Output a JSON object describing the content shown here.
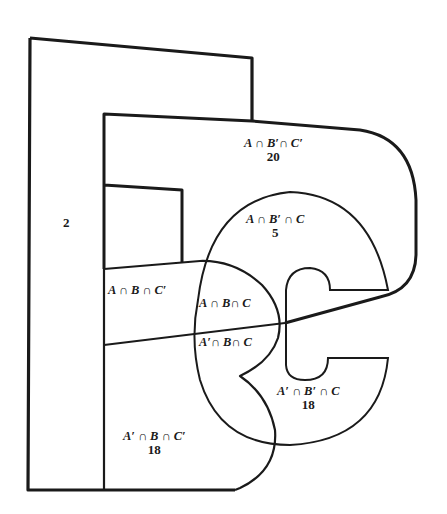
{
  "diagram": {
    "type": "venn-three-set-stylized",
    "colors": {
      "stroke": "#1a1a1a",
      "background": "#ffffff"
    },
    "regions": [
      {
        "id": "outside",
        "label": "",
        "count": "2"
      },
      {
        "id": "a-notb-notc",
        "label": "A ∩ B′∩ C′",
        "count": "20"
      },
      {
        "id": "a-notb-c",
        "label": "A ∩ B′ ∩ C",
        "count": "5"
      },
      {
        "id": "a-b-notc",
        "label": "A ∩ B ∩ C′",
        "count": ""
      },
      {
        "id": "a-b-c",
        "label": "A ∩ B∩ C",
        "count": ""
      },
      {
        "id": "nota-b-c",
        "label": "A′∩ B∩ C",
        "count": ""
      },
      {
        "id": "nota-notb-c",
        "label": "A′ ∩ B′ ∩ C",
        "count": "18"
      },
      {
        "id": "nota-b-notc",
        "label": "A′ ∩ B ∩ C′",
        "count": "18"
      }
    ]
  }
}
